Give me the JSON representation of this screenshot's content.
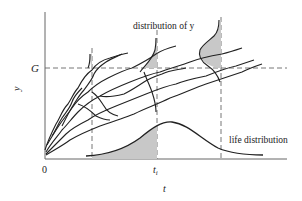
{
  "diagram": {
    "labels": {
      "y_axis": "y",
      "x_axis": "t",
      "threshold": "G",
      "origin": "0",
      "ti_main": "t",
      "ti_sub": "i",
      "distribution_of_y": "distribution of y",
      "life_distribution": "life distribution"
    },
    "colors": {
      "line": "#222222",
      "shade": "#c8c8c8",
      "axis": "#555555",
      "dash": "#666666"
    }
  }
}
